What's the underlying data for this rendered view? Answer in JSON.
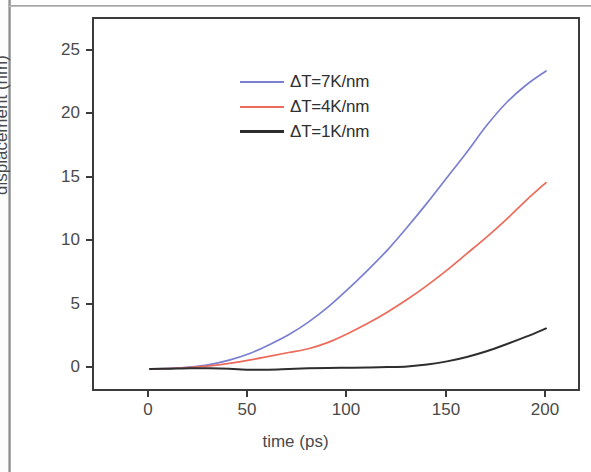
{
  "chart_data": {
    "type": "line",
    "title": "",
    "xlabel": "time (ps)",
    "ylabel": "displacement (nm)",
    "xlim": [
      -12,
      210
    ],
    "ylim": [
      -2.5,
      27
    ],
    "xticks": [
      "0",
      "50",
      "100",
      "150",
      "200"
    ],
    "xtick_values": [
      0,
      50,
      100,
      150,
      200
    ],
    "yticks": [
      "0",
      "5",
      "10",
      "15",
      "20",
      "25"
    ],
    "ytick_values": [
      0,
      5,
      10,
      15,
      20,
      25
    ],
    "grid": false,
    "legend_position": "upper left",
    "x": [
      0,
      10,
      20,
      30,
      40,
      50,
      60,
      70,
      80,
      90,
      100,
      110,
      120,
      130,
      140,
      150,
      160,
      170,
      180,
      190,
      200
    ],
    "series": [
      {
        "name": "ΔT=7K/nm",
        "label": "ΔT=7K/nm",
        "color": "#7b7fd0",
        "values": [
          0.0,
          0.05,
          0.15,
          0.35,
          0.7,
          1.2,
          1.9,
          2.7,
          3.7,
          4.9,
          6.3,
          7.8,
          9.4,
          11.2,
          13.1,
          15.1,
          17.1,
          19.2,
          21.0,
          22.4,
          23.5
        ]
      },
      {
        "name": "ΔT=4K/nm",
        "label": "ΔT=4K/nm",
        "color": "#ec6b5a",
        "values": [
          0.0,
          0.04,
          0.12,
          0.25,
          0.45,
          0.7,
          1.0,
          1.3,
          1.6,
          2.1,
          2.8,
          3.6,
          4.5,
          5.5,
          6.6,
          7.8,
          9.1,
          10.4,
          11.8,
          13.3,
          14.7
        ]
      },
      {
        "name": "ΔT=1K/nm",
        "label": "ΔT=1K/nm",
        "color": "#2e2e2e",
        "values": [
          0.0,
          0.02,
          0.05,
          0.05,
          0.02,
          -0.05,
          -0.05,
          0.0,
          0.05,
          0.08,
          0.1,
          0.12,
          0.15,
          0.2,
          0.35,
          0.6,
          0.95,
          1.4,
          1.95,
          2.55,
          3.2
        ]
      }
    ]
  },
  "axes": {
    "ylabel": "displacement (nm)",
    "xlabel": "time (ps)",
    "ytick_0": "0",
    "ytick_1": "5",
    "ytick_2": "10",
    "ytick_3": "15",
    "ytick_4": "20",
    "ytick_5": "25",
    "xtick_0": "0",
    "xtick_1": "50",
    "xtick_2": "100",
    "xtick_3": "150",
    "xtick_4": "200"
  },
  "legend": {
    "entries": [
      {
        "label": "ΔT=7K/nm",
        "color": "#7b7fd0"
      },
      {
        "label": "ΔT=4K/nm",
        "color": "#ec6b5a"
      },
      {
        "label": "ΔT=1K/nm",
        "color": "#2e2e2e"
      }
    ]
  }
}
